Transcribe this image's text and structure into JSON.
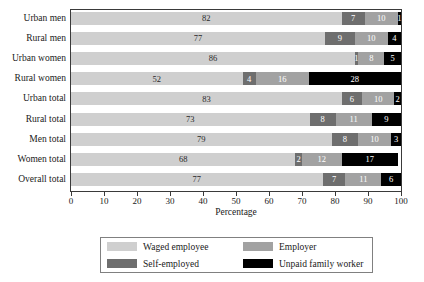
{
  "chart_data": {
    "type": "bar",
    "orientation": "horizontal",
    "stacked": true,
    "normalized_percent": true,
    "title": "",
    "xlabel": "Percentage",
    "ylabel": "",
    "xlim": [
      0,
      100
    ],
    "xticks": [
      "0",
      "10",
      "20",
      "30",
      "40",
      "50",
      "60",
      "70",
      "80",
      "90",
      "100"
    ],
    "grid": false,
    "legend_position": "bottom",
    "categories": [
      "Urban men",
      "Rural men",
      "Urban women",
      "Rural women",
      "Urban total",
      "Rural total",
      "Men total",
      "Women total",
      "Overall total"
    ],
    "series": [
      {
        "name": "Waged employee",
        "color": "#cfcfcf",
        "values": [
          82,
          77,
          86,
          52,
          83,
          73,
          79,
          68,
          77
        ]
      },
      {
        "name": "Self-employed",
        "color": "#6e6e6e",
        "values": [
          7,
          9,
          1,
          4,
          6,
          8,
          8,
          2,
          7
        ]
      },
      {
        "name": "Employer",
        "color": "#a2a2a2",
        "values": [
          10,
          10,
          8,
          16,
          10,
          11,
          10,
          12,
          11
        ]
      },
      {
        "name": "Unpaid family worker",
        "color": "#000000",
        "values": [
          1,
          4,
          5,
          28,
          2,
          9,
          3,
          17,
          6
        ]
      }
    ]
  },
  "legend": {
    "entries": [
      {
        "label": "Waged employee",
        "swatch": "waged"
      },
      {
        "label": "Employer",
        "swatch": "emp"
      },
      {
        "label": "Self-employed",
        "swatch": "self"
      },
      {
        "label": "Unpaid family worker",
        "swatch": "unpaid"
      }
    ]
  },
  "axis": {
    "x_title": "Percentage"
  }
}
